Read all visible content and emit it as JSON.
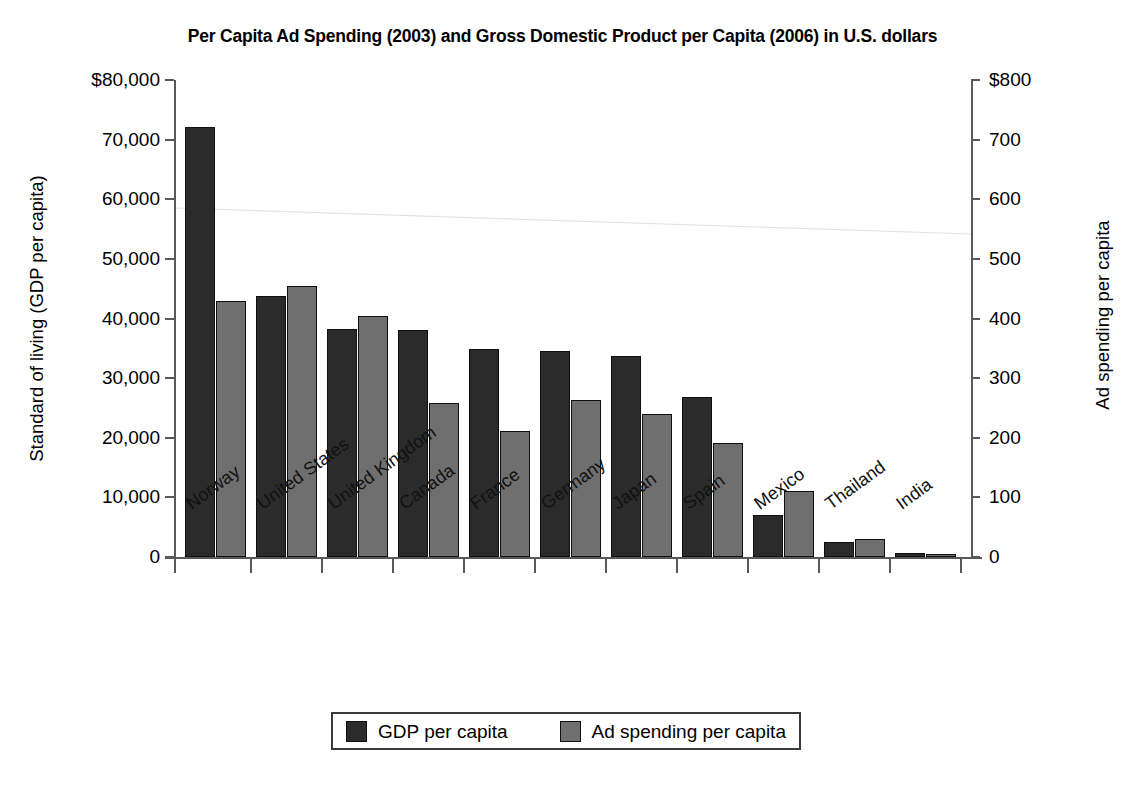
{
  "chart_data": {
    "type": "bar",
    "title": "Per Capita Ad Spending (2003) and Gross Domestic Product per Capita (2006) in U.S. dollars",
    "xlabel": "",
    "ylabel": "Standard of living (GDP per capita)",
    "y2label": "Ad spending per capita",
    "ylim": [
      0,
      80000
    ],
    "y2lim": [
      0,
      800
    ],
    "grid": false,
    "legend_position": "bottom",
    "categories": [
      "Norway",
      "United States",
      "United Kingdom",
      "Canada",
      "France",
      "Germany",
      "Japan",
      "Spain",
      "Mexico",
      "Thailand",
      "India"
    ],
    "series": [
      {
        "name": "GDP per capita",
        "axis": "left",
        "color": "#2b2b2b",
        "values": [
          72200,
          43800,
          38200,
          38000,
          34900,
          34600,
          33700,
          26800,
          7000,
          2600,
          600
        ]
      },
      {
        "name": "Ad spending per capita",
        "axis": "right",
        "color": "#6f6f6f",
        "values": [
          430,
          454,
          405,
          259,
          212,
          264,
          240,
          192,
          111,
          30,
          5
        ]
      }
    ],
    "y_ticks": [
      {
        "value": 80000,
        "label": "$80,000"
      },
      {
        "value": 70000,
        "label": "70,000"
      },
      {
        "value": 60000,
        "label": "60,000"
      },
      {
        "value": 50000,
        "label": "50,000"
      },
      {
        "value": 40000,
        "label": "40,000"
      },
      {
        "value": 30000,
        "label": "30,000"
      },
      {
        "value": 20000,
        "label": "20,000"
      },
      {
        "value": 10000,
        "label": "10,000"
      },
      {
        "value": 0,
        "label": "0"
      }
    ],
    "y2_ticks": [
      {
        "value": 800,
        "label": "$800"
      },
      {
        "value": 700,
        "label": "700"
      },
      {
        "value": 600,
        "label": "600"
      },
      {
        "value": 500,
        "label": "500"
      },
      {
        "value": 400,
        "label": "400"
      },
      {
        "value": 300,
        "label": "300"
      },
      {
        "value": 200,
        "label": "200"
      },
      {
        "value": 100,
        "label": "100"
      },
      {
        "value": 0,
        "label": "0"
      }
    ]
  },
  "legend": {
    "items": [
      {
        "label": "GDP per capita",
        "color": "#2b2b2b"
      },
      {
        "label": "Ad spending per capita",
        "color": "#6f6f6f"
      }
    ]
  }
}
